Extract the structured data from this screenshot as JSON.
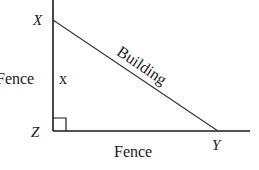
{
  "diagram": {
    "type": "right-triangle",
    "vertices": {
      "X": {
        "label": "X",
        "x": 53,
        "y": 20
      },
      "Z": {
        "label": "Z",
        "x": 53,
        "y": 131
      },
      "Y": {
        "label": "Y",
        "x": 218,
        "y": 131
      }
    },
    "sides": {
      "XZ": {
        "label": "Fence",
        "variable": "x"
      },
      "ZY": {
        "label": "Fence"
      },
      "XY": {
        "label": "Building"
      }
    },
    "right_angle_at": "Z",
    "line_color": "#1a1a1a"
  }
}
